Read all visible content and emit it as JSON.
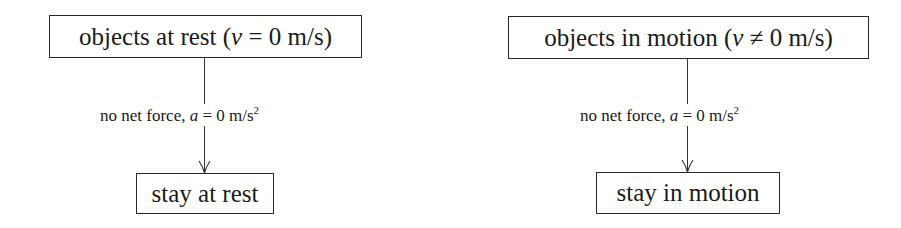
{
  "diagrams": [
    {
      "top": {
        "prefix": "objects at rest (",
        "var": "v",
        "rel": " = 0 m/s)"
      },
      "edge": {
        "prefix": "no net force, ",
        "var": "a",
        "rel": " = 0 m/s",
        "sup": "2"
      },
      "bottom": {
        "label": "stay at rest"
      }
    },
    {
      "top": {
        "prefix": "objects in motion (",
        "var": "v",
        "rel": " ≠ 0 m/s)"
      },
      "edge": {
        "prefix": "no net force, ",
        "var": "a",
        "rel": " = 0 m/s",
        "sup": "2"
      },
      "bottom": {
        "label": "stay in motion"
      }
    }
  ]
}
